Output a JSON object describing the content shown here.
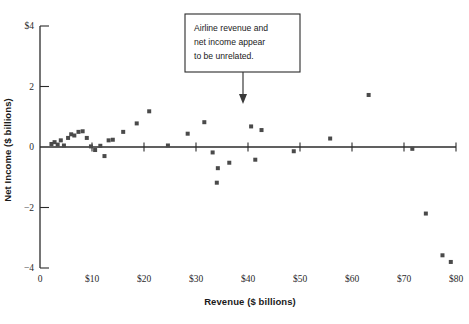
{
  "chart_data": {
    "type": "scatter",
    "title": "",
    "xlabel": "Revenue ($ billions)",
    "ylabel": "Net Income ($ billions)",
    "xlim": [
      0,
      80
    ],
    "ylim": [
      -4,
      4
    ],
    "grid": false,
    "legend": null,
    "xticks": [
      {
        "value": 0,
        "label": "0"
      },
      {
        "value": 10,
        "label": "$10"
      },
      {
        "value": 20,
        "label": "$20"
      },
      {
        "value": 30,
        "label": "$30"
      },
      {
        "value": 40,
        "label": "$40"
      },
      {
        "value": 50,
        "label": "$50"
      },
      {
        "value": 60,
        "label": "$60"
      },
      {
        "value": 70,
        "label": "$70"
      },
      {
        "value": 80,
        "label": "$80"
      }
    ],
    "yticks": [
      {
        "value": 4,
        "label": "$4"
      },
      {
        "value": 2,
        "label": "2"
      },
      {
        "value": 0,
        "label": "0"
      },
      {
        "value": -2,
        "label": "-2"
      },
      {
        "value": -4,
        "label": "-4"
      }
    ],
    "marker_color": "#4a4a4a",
    "marker_size": 4,
    "points": [
      {
        "x": 2.2,
        "y": 0.1
      },
      {
        "x": 2.8,
        "y": 0.16
      },
      {
        "x": 3.4,
        "y": 0.08
      },
      {
        "x": 4.0,
        "y": 0.22
      },
      {
        "x": 4.6,
        "y": 0.05
      },
      {
        "x": 5.4,
        "y": 0.3
      },
      {
        "x": 6.0,
        "y": 0.42
      },
      {
        "x": 6.6,
        "y": 0.38
      },
      {
        "x": 7.4,
        "y": 0.5
      },
      {
        "x": 8.2,
        "y": 0.52
      },
      {
        "x": 9.0,
        "y": 0.3
      },
      {
        "x": 9.8,
        "y": 0.02
      },
      {
        "x": 10.6,
        "y": -0.1
      },
      {
        "x": 11.6,
        "y": 0.04
      },
      {
        "x": 12.4,
        "y": -0.3
      },
      {
        "x": 13.2,
        "y": 0.22
      },
      {
        "x": 14.0,
        "y": 0.24
      },
      {
        "x": 16.0,
        "y": 0.5
      },
      {
        "x": 18.6,
        "y": 0.78
      },
      {
        "x": 21.0,
        "y": 1.18
      },
      {
        "x": 24.6,
        "y": 0.05
      },
      {
        "x": 28.4,
        "y": 0.44
      },
      {
        "x": 31.6,
        "y": 0.82
      },
      {
        "x": 33.2,
        "y": -0.18
      },
      {
        "x": 34.2,
        "y": -0.7
      },
      {
        "x": 34.0,
        "y": -1.18
      },
      {
        "x": 36.4,
        "y": -0.52
      },
      {
        "x": 40.6,
        "y": 0.68
      },
      {
        "x": 42.6,
        "y": 0.56
      },
      {
        "x": 41.4,
        "y": -0.42
      },
      {
        "x": 48.8,
        "y": -0.14
      },
      {
        "x": 55.8,
        "y": 0.28
      },
      {
        "x": 63.2,
        "y": 1.72
      },
      {
        "x": 71.6,
        "y": -0.06
      },
      {
        "x": 74.2,
        "y": -2.2
      },
      {
        "x": 77.4,
        "y": -3.58
      },
      {
        "x": 79.0,
        "y": -3.8
      }
    ],
    "annotation": {
      "lines": [
        "Airline revenue and",
        "net income appear",
        "to be unrelated."
      ],
      "arrow": "down-arrow"
    }
  }
}
